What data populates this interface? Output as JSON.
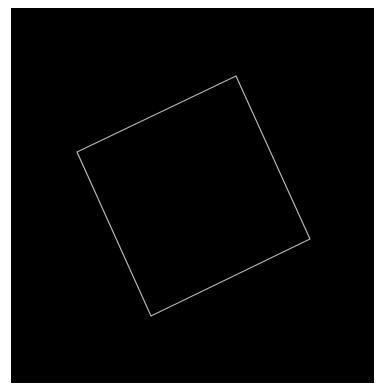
{
  "canvas": {
    "background": "#000000",
    "page_background": "#ffffff",
    "frame": {
      "x": 11,
      "y": 8,
      "width": 363,
      "height": 375
    }
  },
  "shape": {
    "type": "rotated-square-outline",
    "stroke": "#b4b4b4",
    "stroke_width": 1.2,
    "fill": "none",
    "vertices": [
      {
        "x": 236,
        "y": 76
      },
      {
        "x": 310,
        "y": 239
      },
      {
        "x": 151,
        "y": 316
      },
      {
        "x": 77,
        "y": 152
      }
    ]
  }
}
